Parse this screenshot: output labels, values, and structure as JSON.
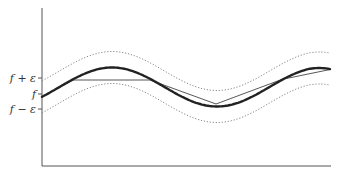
{
  "diagram": {
    "title": "",
    "labels": {
      "upper": "f + ε",
      "middle": "f",
      "lower": "f − ε"
    },
    "curves": {
      "function": {
        "name": "f",
        "style": "thick-solid"
      },
      "upper_band": {
        "name": "f + ε",
        "style": "dotted"
      },
      "lower_band": {
        "name": "f − ε",
        "style": "dotted"
      },
      "approximation": {
        "name": "piecewise-linear approximation",
        "style": "thin-solid"
      }
    },
    "colors": {
      "axis": "#555555",
      "function": "#222222",
      "band": "#888888",
      "approximation": "#444444"
    }
  }
}
